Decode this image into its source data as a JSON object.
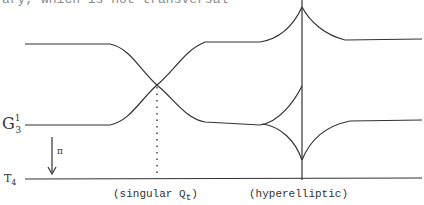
{
  "header_fragment": "ary, which is not transversal",
  "labels": {
    "g_base": "G",
    "g_sup": "1",
    "g_sub": "3",
    "t_base": "T",
    "t_sub": "4",
    "projection": "π",
    "singular": "(singular  Q",
    "singular_sub": "t",
    "singular_close": ")",
    "hyperelliptic": "(hyperelliptic)"
  },
  "colors": {
    "ink": "#333333",
    "background": "#ffffff"
  }
}
